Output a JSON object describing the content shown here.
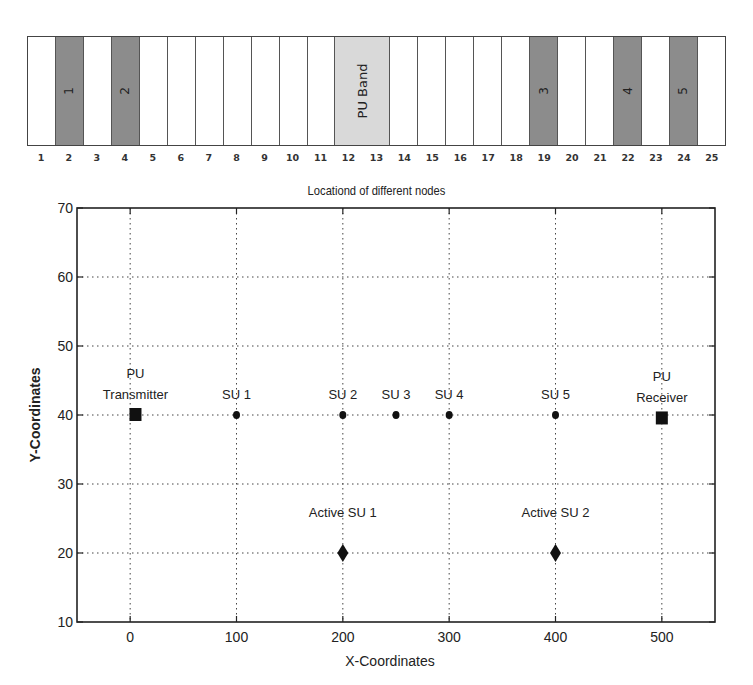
{
  "chart_data": [
    {
      "type": "table",
      "title": "",
      "xlabel": "Locationd of different nodes",
      "columns": [
        1,
        2,
        3,
        4,
        5,
        6,
        7,
        8,
        9,
        10,
        11,
        12,
        13,
        14,
        15,
        16,
        17,
        18,
        19,
        20,
        21,
        22,
        23,
        24,
        25
      ],
      "cells": [
        {
          "col": 1,
          "fill": "empty"
        },
        {
          "col": 2,
          "fill": "node",
          "label": "1"
        },
        {
          "col": 3,
          "fill": "empty"
        },
        {
          "col": 4,
          "fill": "node",
          "label": "2"
        },
        {
          "col": 5,
          "fill": "empty"
        },
        {
          "col": 6,
          "fill": "empty"
        },
        {
          "col": 7,
          "fill": "empty"
        },
        {
          "col": 8,
          "fill": "empty"
        },
        {
          "col": 9,
          "fill": "empty"
        },
        {
          "col": 10,
          "fill": "empty"
        },
        {
          "col": 11,
          "fill": "empty"
        },
        {
          "col": "12-13",
          "fill": "pu",
          "label": "PU Band"
        },
        {
          "col": 14,
          "fill": "empty"
        },
        {
          "col": 15,
          "fill": "empty"
        },
        {
          "col": 16,
          "fill": "empty"
        },
        {
          "col": 17,
          "fill": "empty"
        },
        {
          "col": 18,
          "fill": "empty"
        },
        {
          "col": 19,
          "fill": "node",
          "label": "3"
        },
        {
          "col": 20,
          "fill": "empty"
        },
        {
          "col": 21,
          "fill": "empty"
        },
        {
          "col": 22,
          "fill": "node",
          "label": "4"
        },
        {
          "col": 23,
          "fill": "empty"
        },
        {
          "col": 24,
          "fill": "node",
          "label": "5"
        },
        {
          "col": 25,
          "fill": "empty"
        }
      ],
      "colors": {
        "node": "#8c8c8c",
        "pu": "#d9d9d9",
        "empty": "#ffffff"
      }
    },
    {
      "type": "scatter",
      "title": "",
      "xlabel": "X-Coordinates",
      "ylabel": "Y-Coordinates",
      "xlim": [
        -50,
        550
      ],
      "ylim": [
        10,
        70
      ],
      "xticks": [
        0,
        100,
        200,
        300,
        400,
        500
      ],
      "yticks": [
        10,
        20,
        30,
        40,
        50,
        60,
        70
      ],
      "grid": true,
      "series": [
        {
          "name": "PU",
          "marker": "square",
          "points": [
            {
              "x": 5,
              "y": 40,
              "label": "PU\nTransmitter"
            },
            {
              "x": 500,
              "y": 39.5,
              "label": "PU\nReceiver"
            }
          ]
        },
        {
          "name": "SU",
          "marker": "circle",
          "points": [
            {
              "x": 100,
              "y": 40,
              "label": "SU 1"
            },
            {
              "x": 200,
              "y": 40,
              "label": "SU 2"
            },
            {
              "x": 250,
              "y": 40,
              "label": "SU 3"
            },
            {
              "x": 300,
              "y": 40,
              "label": "SU 4"
            },
            {
              "x": 400,
              "y": 40,
              "label": "SU 5"
            }
          ]
        },
        {
          "name": "Active SU",
          "marker": "diamond",
          "points": [
            {
              "x": 200,
              "y": 20,
              "label": "Active SU 1"
            },
            {
              "x": 400,
              "y": 20,
              "label": "Active SU 2"
            }
          ]
        }
      ]
    }
  ]
}
